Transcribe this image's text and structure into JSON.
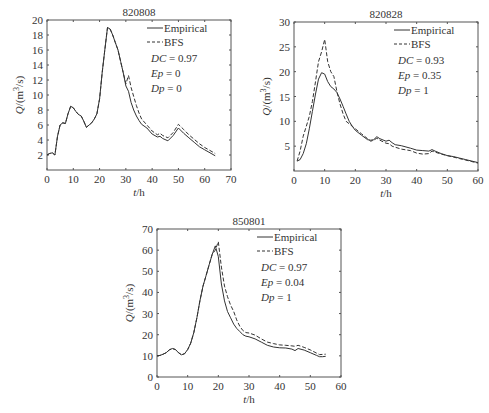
{
  "chart_data": [
    {
      "type": "line",
      "title": "820808",
      "xlabel": "t/h",
      "ylabel": "Q/(m³/s)",
      "xlim": [
        0,
        70
      ],
      "ylim": [
        0,
        20
      ],
      "xticks": [
        0,
        10,
        20,
        30,
        40,
        50,
        60,
        70
      ],
      "yticks": [
        2,
        4,
        6,
        8,
        10,
        12,
        14,
        16,
        18,
        20
      ],
      "grid": false,
      "legend": {
        "position": "upper right",
        "entries": [
          "Empirical",
          "BFS"
        ]
      },
      "annotations": [
        {
          "label": "DC",
          "value": "0.97"
        },
        {
          "label": "Ep",
          "value": "0"
        },
        {
          "label": "Dp",
          "value": "0"
        }
      ],
      "box": {
        "x0": 47,
        "y0": 20,
        "x1": 231,
        "y1": 170
      },
      "series": [
        {
          "name": "Empirical",
          "style": "solid",
          "x": [
            0,
            1,
            2,
            3,
            4,
            5,
            6,
            7,
            8,
            9,
            10,
            11,
            12,
            13,
            14,
            15,
            16,
            17,
            18,
            19,
            20,
            21,
            22,
            23,
            24,
            25,
            26,
            27,
            28,
            29,
            30,
            31,
            32,
            33,
            34,
            35,
            36,
            38,
            40,
            42,
            43,
            44,
            46,
            48,
            50,
            52,
            54,
            56,
            58,
            60,
            62,
            64
          ],
          "y": [
            2.0,
            2.2,
            2.3,
            2.0,
            4.5,
            6.0,
            6.3,
            6.2,
            7.5,
            8.5,
            8.3,
            7.8,
            7.4,
            7.2,
            6.5,
            5.7,
            6.0,
            6.3,
            6.8,
            7.5,
            9.5,
            13.0,
            16.0,
            19.0,
            18.8,
            18.0,
            17.0,
            16.0,
            14.5,
            13.0,
            11.2,
            10.5,
            9.0,
            8.0,
            7.2,
            6.6,
            6.1,
            5.6,
            4.8,
            4.4,
            4.5,
            4.2,
            3.9,
            4.6,
            5.6,
            4.9,
            4.3,
            3.7,
            3.1,
            2.7,
            2.3,
            1.9
          ]
        },
        {
          "name": "BFS",
          "style": "dashed",
          "x": [
            0,
            1,
            2,
            3,
            4,
            5,
            6,
            7,
            8,
            9,
            10,
            11,
            12,
            13,
            14,
            15,
            16,
            17,
            18,
            19,
            20,
            21,
            22,
            23,
            24,
            25,
            26,
            27,
            28,
            29,
            30,
            31,
            32,
            33,
            34,
            35,
            36,
            38,
            40,
            42,
            43,
            44,
            46,
            48,
            50,
            52,
            54,
            56,
            58,
            60,
            62,
            64
          ],
          "y": [
            2.0,
            2.2,
            2.3,
            2.0,
            4.5,
            6.0,
            6.3,
            6.2,
            7.5,
            8.5,
            8.3,
            7.8,
            7.4,
            7.2,
            6.5,
            5.7,
            6.0,
            6.3,
            6.8,
            7.5,
            9.5,
            13.0,
            16.0,
            19.0,
            18.8,
            18.0,
            17.0,
            16.0,
            14.5,
            13.0,
            11.5,
            12.6,
            11.0,
            9.8,
            8.6,
            7.6,
            6.8,
            6.0,
            5.2,
            4.7,
            4.9,
            4.6,
            4.3,
            5.0,
            6.1,
            5.4,
            4.7,
            4.1,
            3.5,
            3.0,
            2.6,
            2.2
          ]
        }
      ]
    },
    {
      "type": "line",
      "title": "820828",
      "xlabel": "t/h",
      "ylabel": "Q/(m³/s)",
      "xlim": [
        0,
        60
      ],
      "ylim": [
        0,
        30
      ],
      "xticks": [
        0,
        10,
        20,
        30,
        40,
        50,
        60
      ],
      "yticks": [
        5,
        10,
        15,
        20,
        25,
        30
      ],
      "grid": false,
      "legend": {
        "position": "upper right",
        "entries": [
          "Empirical",
          "BFS"
        ]
      },
      "annotations": [
        {
          "label": "DC",
          "value": "0.93"
        },
        {
          "label": "Ep",
          "value": "0.35"
        },
        {
          "label": "Dp",
          "value": "1"
        }
      ],
      "box": {
        "x0": 294,
        "y0": 22,
        "x1": 478,
        "y1": 171
      },
      "series": [
        {
          "name": "Empirical",
          "style": "solid",
          "x": [
            1,
            2,
            3,
            4,
            5,
            6,
            7,
            8,
            9,
            10,
            11,
            12,
            13,
            14,
            15,
            16,
            17,
            18,
            19,
            20,
            22,
            24,
            25,
            26,
            27,
            28,
            30,
            31,
            32,
            33,
            35,
            38,
            40,
            42,
            44,
            45,
            46,
            48,
            50,
            52,
            54,
            56,
            58,
            60
          ],
          "y": [
            2.0,
            2.3,
            3.5,
            5.5,
            8.5,
            12.0,
            15.5,
            18.5,
            19.8,
            19.5,
            18.0,
            17.0,
            16.5,
            15.8,
            14.5,
            13.0,
            11.5,
            10.0,
            9.0,
            8.2,
            7.2,
            6.3,
            6.2,
            6.3,
            6.9,
            6.5,
            6.0,
            6.2,
            5.7,
            5.3,
            5.1,
            4.6,
            4.2,
            4.1,
            4.0,
            4.3,
            4.0,
            3.5,
            3.1,
            2.9,
            2.6,
            2.3,
            2.0,
            1.7
          ]
        },
        {
          "name": "BFS",
          "style": "dashed",
          "x": [
            1,
            2,
            3,
            4,
            5,
            6,
            7,
            8,
            9,
            10,
            11,
            12,
            13,
            14,
            15,
            16,
            17,
            18,
            19,
            20,
            22,
            24,
            25,
            26,
            27,
            28,
            30,
            31,
            32,
            33,
            35,
            38,
            40,
            42,
            44,
            45,
            46,
            48,
            50,
            52,
            54,
            56,
            58,
            60
          ],
          "y": [
            2.0,
            4.0,
            7.0,
            9.0,
            11.0,
            14.0,
            18.0,
            22.0,
            24.0,
            26.5,
            22.0,
            20.0,
            19.0,
            16.0,
            13.5,
            11.5,
            10.0,
            9.5,
            9.0,
            8.5,
            7.5,
            6.5,
            6.0,
            6.2,
            6.6,
            6.2,
            5.6,
            5.5,
            5.0,
            4.8,
            4.4,
            4.1,
            3.6,
            3.4,
            3.5,
            4.0,
            3.8,
            3.4,
            3.1,
            2.8,
            2.5,
            2.2,
            1.9,
            1.6
          ]
        }
      ]
    },
    {
      "type": "line",
      "title": "850801",
      "xlabel": "t/h",
      "ylabel": "Q/(m³/s)",
      "xlim": [
        0,
        60
      ],
      "ylim": [
        0,
        70
      ],
      "xticks": [
        0,
        10,
        20,
        30,
        40,
        50,
        60
      ],
      "yticks": [
        0,
        10,
        20,
        30,
        40,
        50,
        60,
        70
      ],
      "grid": false,
      "legend": {
        "position": "upper right",
        "entries": [
          "Empirical",
          "BFS"
        ]
      },
      "annotations": [
        {
          "label": "DC",
          "value": "0.97"
        },
        {
          "label": "Ep",
          "value": "0.04"
        },
        {
          "label": "Dp",
          "value": "1"
        }
      ],
      "box": {
        "x0": 157,
        "y0": 229,
        "x1": 341,
        "y1": 377
      },
      "series": [
        {
          "name": "Empirical",
          "style": "solid",
          "x": [
            0,
            1,
            2,
            3,
            4,
            5,
            6,
            7,
            8,
            9,
            10,
            11,
            12,
            13,
            14,
            15,
            16,
            17,
            18,
            19,
            20,
            21,
            22,
            23,
            24,
            25,
            26,
            27,
            28,
            29,
            30,
            32,
            34,
            36,
            38,
            40,
            42,
            44,
            45,
            46,
            48,
            50,
            52,
            53,
            54,
            55
          ],
          "y": [
            10.0,
            10.2,
            10.8,
            11.5,
            12.8,
            13.5,
            13.0,
            11.5,
            10.5,
            11.0,
            13.0,
            16.0,
            21.0,
            28.0,
            36.0,
            43.0,
            48.0,
            53.0,
            58.0,
            62.0,
            57.0,
            44.0,
            36.0,
            31.0,
            28.0,
            25.0,
            23.0,
            21.5,
            20.0,
            19.3,
            19.0,
            18.0,
            16.5,
            15.0,
            14.2,
            13.8,
            13.7,
            13.2,
            12.5,
            13.5,
            12.7,
            11.5,
            10.2,
            9.6,
            9.6,
            9.8
          ]
        },
        {
          "name": "BFS",
          "style": "dashed",
          "x": [
            0,
            1,
            2,
            3,
            4,
            5,
            6,
            7,
            8,
            9,
            10,
            11,
            12,
            13,
            14,
            15,
            16,
            17,
            18,
            19,
            20,
            21,
            22,
            23,
            24,
            25,
            26,
            27,
            28,
            29,
            30,
            32,
            34,
            36,
            38,
            40,
            42,
            44,
            45,
            46,
            48,
            50,
            52,
            53,
            54,
            55
          ],
          "y": [
            10.0,
            10.2,
            10.8,
            11.5,
            12.8,
            13.5,
            13.0,
            11.5,
            10.5,
            11.0,
            13.0,
            16.0,
            21.0,
            28.0,
            36.0,
            43.0,
            48.0,
            53.0,
            58.0,
            60.0,
            64.0,
            52.0,
            43.0,
            38.0,
            34.0,
            31.0,
            27.0,
            24.0,
            22.0,
            21.0,
            20.8,
            19.8,
            18.0,
            16.5,
            15.8,
            15.2,
            15.0,
            14.7,
            14.5,
            15.0,
            14.0,
            12.8,
            11.3,
            10.6,
            10.7,
            10.8
          ]
        }
      ]
    }
  ]
}
